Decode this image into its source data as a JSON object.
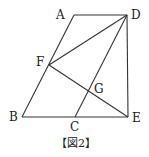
{
  "figure": {
    "caption": "【図2】",
    "points": {
      "A": {
        "label": "A",
        "x": 74,
        "y": 15,
        "lx": 56,
        "ly": 19
      },
      "D": {
        "label": "D",
        "x": 127,
        "y": 15,
        "lx": 131,
        "ly": 19
      },
      "F": {
        "label": "F",
        "x": 49,
        "y": 65,
        "lx": 36,
        "ly": 66
      },
      "G": {
        "label": "G",
        "x": 90,
        "y": 92,
        "lx": 94,
        "ly": 93
      },
      "B": {
        "label": "B",
        "x": 22,
        "y": 117,
        "lx": 9,
        "ly": 121
      },
      "C": {
        "label": "C",
        "x": 75,
        "y": 117,
        "lx": 70,
        "ly": 131
      },
      "E": {
        "label": "E",
        "x": 128,
        "y": 117,
        "lx": 132,
        "ly": 122
      }
    },
    "segments": [
      [
        "A",
        "D"
      ],
      [
        "A",
        "B"
      ],
      [
        "B",
        "E"
      ],
      [
        "D",
        "E"
      ],
      [
        "D",
        "C"
      ],
      [
        "D",
        "F"
      ],
      [
        "F",
        "E"
      ]
    ]
  }
}
